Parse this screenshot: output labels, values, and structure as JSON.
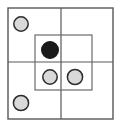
{
  "figure": {
    "title": "",
    "canvas": {
      "width": 120,
      "height": 126,
      "background": "#ffffff"
    },
    "colors": {
      "line": "#58585a",
      "inner_line": "#6b6b6d",
      "circle_stroke": "#2b2b2b",
      "circle_fill_light": "#d9d9d9",
      "circle_fill_dark": "#1a1a1a"
    },
    "outer_square": {
      "label": "outer square",
      "x": 8,
      "y": 8,
      "width": 105,
      "height": 111,
      "stroke_width": 1.4
    },
    "divider_vertical": {
      "label": "vertical divider",
      "x": 61,
      "y1": 8,
      "y2": 119
    },
    "divider_horizontal": {
      "label": "horizontal divider",
      "y": 62,
      "x1": 8,
      "x2": 113
    },
    "inner_square": {
      "label": "inner square",
      "x": 35,
      "y": 35,
      "width": 57,
      "height": 55,
      "stroke_width": 1.2
    },
    "circles": [
      {
        "name": "circle-top-left-outer",
        "cx": 21,
        "cy": 24,
        "r": 7.2,
        "fill": "#d9d9d9",
        "state": "light"
      },
      {
        "name": "circle-center-dark",
        "cx": 50,
        "cy": 50,
        "r": 8.4,
        "fill": "#1a1a1a",
        "state": "dark"
      },
      {
        "name": "circle-inner-lower-left",
        "cx": 50,
        "cy": 77,
        "r": 7.2,
        "fill": "#d9d9d9",
        "state": "light"
      },
      {
        "name": "circle-inner-lower-right",
        "cx": 75,
        "cy": 77,
        "r": 7.6,
        "fill": "#d9d9d9",
        "state": "light"
      },
      {
        "name": "circle-bottom-left-outer",
        "cx": 21,
        "cy": 103,
        "r": 7.6,
        "fill": "#d9d9d9",
        "state": "light"
      }
    ]
  }
}
